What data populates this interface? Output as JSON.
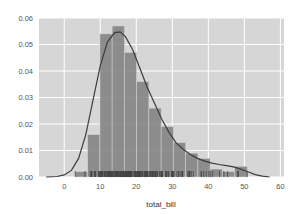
{
  "chart_data": {
    "type": "bar",
    "subtype": "histogram_with_kde_and_rug",
    "title": "",
    "xlabel": "total_bill",
    "ylabel": "",
    "xlim": [
      -7,
      61
    ],
    "ylim": [
      0,
      0.06
    ],
    "grid": true,
    "legend": null,
    "x_ticks": [
      0,
      10,
      20,
      30,
      40,
      50,
      60
    ],
    "x_tick_labels": [
      "0",
      "10",
      "20",
      "30",
      "40",
      "50",
      "60"
    ],
    "y_ticks": [
      0.0,
      0.01,
      0.02,
      0.03,
      0.04,
      0.05,
      0.06
    ],
    "y_tick_labels": [
      "0.00",
      "0.01",
      "0.02",
      "0.03",
      "0.04",
      "0.05",
      "0.06"
    ],
    "bins": [
      {
        "start": 3.1,
        "end": 6.5,
        "density": 0.002
      },
      {
        "start": 6.5,
        "end": 9.9,
        "density": 0.016
      },
      {
        "start": 9.9,
        "end": 13.3,
        "density": 0.054
      },
      {
        "start": 13.3,
        "end": 16.7,
        "density": 0.057
      },
      {
        "start": 16.7,
        "end": 20.1,
        "density": 0.047
      },
      {
        "start": 20.1,
        "end": 23.5,
        "density": 0.036
      },
      {
        "start": 23.5,
        "end": 26.9,
        "density": 0.026
      },
      {
        "start": 26.9,
        "end": 30.3,
        "density": 0.019
      },
      {
        "start": 30.3,
        "end": 33.7,
        "density": 0.013
      },
      {
        "start": 33.7,
        "end": 37.1,
        "density": 0.009
      },
      {
        "start": 37.1,
        "end": 40.5,
        "density": 0.007
      },
      {
        "start": 40.5,
        "end": 43.9,
        "density": 0.003
      },
      {
        "start": 43.9,
        "end": 47.3,
        "density": 0.002
      },
      {
        "start": 47.3,
        "end": 50.8,
        "density": 0.004
      }
    ],
    "kde": {
      "x": [
        -5,
        -2,
        0,
        2,
        4,
        6,
        8,
        10,
        12,
        14,
        15.5,
        17,
        19,
        21,
        23,
        25,
        27,
        29,
        31,
        33,
        35,
        37,
        39,
        41,
        43,
        45,
        47,
        49,
        51,
        53,
        55,
        57
      ],
      "y": [
        0.0,
        0.0002,
        0.0008,
        0.0025,
        0.007,
        0.016,
        0.029,
        0.042,
        0.051,
        0.0545,
        0.0548,
        0.053,
        0.048,
        0.041,
        0.034,
        0.028,
        0.022,
        0.017,
        0.013,
        0.0105,
        0.0085,
        0.007,
        0.006,
        0.0052,
        0.0047,
        0.0043,
        0.0038,
        0.003,
        0.002,
        0.0009,
        0.0003,
        0.0
      ]
    },
    "rug": [
      3.07,
      5.75,
      7.25,
      7.51,
      7.56,
      7.74,
      8.35,
      8.51,
      8.52,
      8.58,
      8.77,
      9.55,
      9.6,
      9.68,
      9.78,
      10.07,
      10.27,
      10.33,
      10.34,
      10.51,
      10.59,
      10.63,
      10.65,
      11.02,
      11.17,
      11.24,
      11.35,
      11.59,
      11.61,
      11.87,
      12.02,
      12.16,
      12.26,
      12.43,
      12.46,
      12.54,
      12.6,
      12.66,
      12.74,
      12.9,
      13.0,
      13.03,
      13.13,
      13.27,
      13.37,
      13.39,
      13.42,
      13.51,
      13.81,
      13.94,
      14.07,
      14.15,
      14.26,
      14.48,
      14.52,
      14.73,
      14.78,
      14.83,
      15.01,
      15.04,
      15.36,
      15.48,
      15.53,
      15.69,
      15.77,
      15.95,
      15.98,
      16.0,
      16.21,
      16.29,
      16.4,
      16.47,
      16.58,
      16.66,
      16.82,
      16.93,
      16.97,
      16.99,
      17.07,
      17.26,
      17.29,
      17.31,
      17.46,
      17.51,
      17.59,
      17.78,
      17.81,
      17.89,
      17.92,
      18.04,
      18.15,
      18.24,
      18.26,
      18.28,
      18.29,
      18.35,
      18.43,
      18.64,
      18.69,
      18.71,
      18.78,
      19.08,
      19.44,
      19.49,
      19.65,
      19.77,
      19.81,
      19.82,
      20.08,
      20.23,
      20.27,
      20.29,
      20.45,
      20.49,
      20.53,
      20.65,
      20.69,
      20.76,
      20.9,
      20.92,
      21.01,
      21.16,
      21.5,
      21.58,
      21.7,
      22.12,
      22.23,
      22.42,
      22.49,
      22.67,
      22.75,
      22.76,
      22.82,
      23.1,
      23.17,
      23.33,
      23.68,
      23.95,
      24.01,
      24.06,
      24.27,
      24.52,
      24.55,
      24.59,
      24.71,
      25.0,
      25.21,
      25.28,
      25.29,
      25.56,
      25.71,
      25.89,
      26.41,
      26.59,
      26.86,
      26.88,
      27.05,
      27.18,
      27.2,
      27.28,
      28.15,
      28.17,
      28.44,
      28.55,
      28.97,
      29.03,
      29.8,
      29.85,
      29.93,
      30.06,
      30.14,
      30.4,
      30.46,
      31.27,
      31.71,
      31.85,
      32.4,
      32.68,
      32.83,
      32.9,
      34.3,
      34.63,
      34.65,
      34.81,
      34.83,
      35.26,
      35.83,
      38.01,
      38.07,
      38.73,
      39.42,
      40.17,
      40.55,
      41.19,
      43.11,
      44.3,
      45.35,
      48.17,
      48.27,
      48.33,
      50.81
    ],
    "colors": {
      "background": "#eaeaf2",
      "plot_bg_rendered": "#d9d9d9",
      "grid": "#ffffff",
      "bar": "#7f7f7f",
      "kde_line": "#444444",
      "rug": "#444444"
    }
  }
}
